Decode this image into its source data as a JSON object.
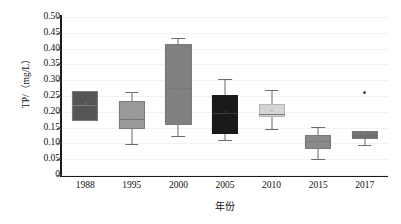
{
  "chart_data": {
    "type": "box",
    "title": "",
    "xlabel": "年份",
    "ylabel": "TP/（mg/L）",
    "ylim": [
      0,
      0.5
    ],
    "grid": true,
    "legend": "none",
    "categories": [
      "1988",
      "1995",
      "2000",
      "2005",
      "2010",
      "2015",
      "2017"
    ],
    "ytick_labels": [
      "0.50",
      "0.45",
      "0.40",
      "0.35",
      "0.30",
      "0.25",
      "0.20",
      "0.15",
      "0.10",
      "0.05",
      "0"
    ],
    "ytick_values": [
      0.5,
      0.45,
      0.4,
      0.35,
      0.3,
      0.25,
      0.2,
      0.15,
      0.1,
      0.05,
      0
    ],
    "boxes": [
      {
        "category": "1988",
        "whisker_low": 0.172,
        "q1": 0.172,
        "median": 0.222,
        "mean": 0.222,
        "q3": 0.265,
        "whisker_high": 0.265,
        "outliers": [],
        "fill": "#555555"
      },
      {
        "category": "1995",
        "whisker_low": 0.098,
        "q1": 0.145,
        "median": 0.178,
        "mean": 0.18,
        "q3": 0.235,
        "whisker_high": 0.262,
        "outliers": [],
        "fill": "#9a9a9a"
      },
      {
        "category": "2000",
        "whisker_low": 0.122,
        "q1": 0.158,
        "median": 0.275,
        "mean": 0.272,
        "q3": 0.415,
        "whisker_high": 0.435,
        "outliers": [],
        "fill": "#808080"
      },
      {
        "category": "2005",
        "whisker_low": 0.11,
        "q1": 0.13,
        "median": 0.196,
        "mean": 0.196,
        "q3": 0.252,
        "whisker_high": 0.305,
        "outliers": [],
        "fill": "#1a1a1a"
      },
      {
        "category": "2010",
        "whisker_low": 0.147,
        "q1": 0.182,
        "median": 0.194,
        "mean": 0.198,
        "q3": 0.225,
        "whisker_high": 0.268,
        "outliers": [],
        "fill": "#d5d5d5"
      },
      {
        "category": "2015",
        "whisker_low": 0.05,
        "q1": 0.082,
        "median": 0.108,
        "mean": 0.106,
        "q3": 0.128,
        "whisker_high": 0.152,
        "outliers": [],
        "fill": "#8a8a8a"
      },
      {
        "category": "2017",
        "whisker_low": 0.095,
        "q1": 0.115,
        "median": 0.134,
        "mean": 0.13,
        "q3": 0.14,
        "whisker_high": 0.14,
        "outliers": [
          0.26
        ],
        "fill": "#6e6e6e"
      }
    ]
  }
}
